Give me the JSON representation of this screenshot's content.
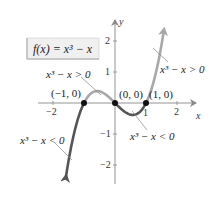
{
  "chart_data": {
    "type": "line",
    "title": "f(x) = x³ − x",
    "function": "x^3 - x",
    "xlabel": "x",
    "ylabel": "y",
    "xlim": [
      -2.5,
      2.6
    ],
    "ylim": [
      -2.5,
      2.6
    ],
    "x_ticks": [
      -2,
      1,
      2
    ],
    "x_tick_labels": [
      "−2",
      "1",
      "2"
    ],
    "y_ticks": [
      2,
      1,
      -1,
      -2
    ],
    "y_tick_labels": [
      "2",
      "1",
      "−1",
      "−2"
    ],
    "grid": false,
    "series": [
      {
        "name": "x³ − x < 0 (x < −1)",
        "x_range": [
          -1.58,
          -1
        ],
        "color": "#555555"
      },
      {
        "name": "x³ − x > 0 (−1 < x < 0)",
        "x_range": [
          -1,
          0
        ],
        "color": "#a8a8a8"
      },
      {
        "name": "x³ − x < 0 (0 < x < 1)",
        "x_range": [
          0,
          1
        ],
        "color": "#555555"
      },
      {
        "name": "x³ − x > 0 (x > 1)",
        "x_range": [
          1,
          1.58
        ],
        "color": "#a8a8a8"
      }
    ],
    "points": [
      {
        "x": -1,
        "y": 0,
        "label": "(−1, 0)"
      },
      {
        "x": 0,
        "y": 0,
        "label": "(0, 0)"
      },
      {
        "x": 1,
        "y": 0,
        "label": "(1, 0)"
      }
    ],
    "annotations": [
      {
        "text": "x³ − x > 0",
        "region": "(−1, 0)"
      },
      {
        "text": "x³ − x > 0",
        "region": "(1, ∞)"
      },
      {
        "text": "x³ − x < 0",
        "region": "(−∞, −1)"
      },
      {
        "text": "x³ − x < 0",
        "region": "(0, 1)"
      }
    ]
  },
  "labels": {
    "function_box": "f(x) = x³ − x",
    "x_axis": "x",
    "y_axis": "y",
    "pt_neg1": "(−1, 0)",
    "pt_0": "(0, 0)",
    "pt_1": "(1, 0)",
    "ann_pos_left": "x³ − x > 0",
    "ann_pos_right": "x³ − x > 0",
    "ann_neg_left": "x³ − x < 0",
    "ann_neg_mid": "x³ − x < 0",
    "tick_x_neg2": "−2",
    "tick_x_1": "1",
    "tick_x_2": "2",
    "tick_y_2": "2",
    "tick_y_1": "1",
    "tick_y_neg1": "−1",
    "tick_y_neg2": "−2"
  },
  "colors": {
    "positive_curve": "#a8a8a8",
    "negative_curve": "#555555",
    "axis": "#888888",
    "box_bg": "#f0f0f0"
  }
}
